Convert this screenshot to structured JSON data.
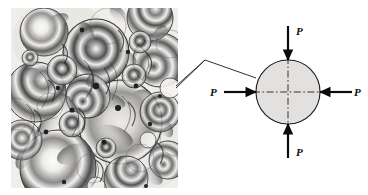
{
  "figure": {
    "type": "technical-illustration",
    "background_color": "#ffffff",
    "width": 368,
    "height": 195
  },
  "micrograph": {
    "name": "photoelastic-granular-assembly",
    "description": "Grayscale photoelastic micrograph of a packed assembly of circular disks showing stress fringe patterns at inter-particle contacts",
    "frame": {
      "x": 11,
      "y": 8,
      "width": 167,
      "height": 180
    },
    "ink_color": "#1a1a1a",
    "paper_color": "#f2f0ee"
  },
  "leader_lines": {
    "name": "callout-leader",
    "color": "#1a1a1a",
    "stroke_width": 0.9,
    "points_upper": "176,86 205,60 256,78",
    "points_lower": "176,88 205,60"
  },
  "free_body_diagram": {
    "name": "loaded-disk-free-body-diagram",
    "disk": {
      "cx": 288,
      "cy": 92,
      "r": 32,
      "fill": "#e3e1df",
      "stroke": "#1a1a1a",
      "stroke_width": 1.1
    },
    "centerlines": {
      "style": "dash-dot",
      "color": "#2a2a2a",
      "vertical": {
        "x": 288,
        "y1": 57,
        "y2": 127
      },
      "horizontal": {
        "y": 92,
        "x1": 253,
        "x2": 323
      }
    },
    "loads": [
      {
        "id": "load-top",
        "label": "P",
        "direction": "down",
        "arrow_tail": {
          "x": 288,
          "y": 26
        },
        "arrow_tip": {
          "x": 288,
          "y": 60
        },
        "label_pos": {
          "x": 296,
          "y": 35
        }
      },
      {
        "id": "load-bottom",
        "label": "P",
        "direction": "up",
        "arrow_tail": {
          "x": 288,
          "y": 158
        },
        "arrow_tip": {
          "x": 288,
          "y": 124
        },
        "label_pos": {
          "x": 296,
          "y": 156
        }
      },
      {
        "id": "load-left",
        "label": "P",
        "direction": "right",
        "arrow_tail": {
          "x": 224,
          "y": 92
        },
        "arrow_tip": {
          "x": 256,
          "y": 92
        },
        "label_pos": {
          "x": 213,
          "y": 96
        }
      },
      {
        "id": "load-right",
        "label": "P",
        "direction": "left",
        "arrow_tail": {
          "x": 352,
          "y": 92
        },
        "arrow_tip": {
          "x": 320,
          "y": 92
        },
        "label_pos": {
          "x": 355,
          "y": 96
        }
      }
    ],
    "arrow_color": "#0b0b0b",
    "arrow_stroke_width": 2.2
  },
  "labels": {
    "load_symbol": "P"
  }
}
